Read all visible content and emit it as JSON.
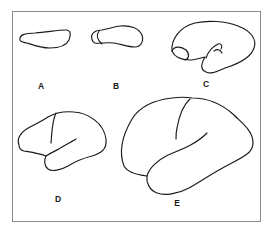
{
  "figure": {
    "colors": {
      "background": "#ffffff",
      "line": "#1a1a1a",
      "frame": "#8a8a8a"
    },
    "panels": [
      {
        "id": "A",
        "label": "A",
        "shape": "brain-outline-a"
      },
      {
        "id": "B",
        "label": "B",
        "shape": "brain-outline-b"
      },
      {
        "id": "C",
        "label": "C",
        "shape": "brain-outline-c"
      },
      {
        "id": "D",
        "label": "D",
        "shape": "brain-outline-d"
      },
      {
        "id": "E",
        "label": "E",
        "shape": "brain-outline-e"
      }
    ]
  }
}
